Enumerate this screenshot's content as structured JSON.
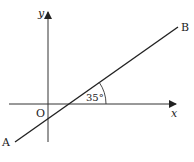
{
  "diagram": {
    "axes": {
      "x_label": "x",
      "y_label": "y",
      "origin_label": "O"
    },
    "line": {
      "start_label": "A",
      "end_label": "B"
    },
    "angle": {
      "label": "35°",
      "value_degrees": 35
    },
    "colors": {
      "stroke": "#222222",
      "background": "#ffffff"
    }
  }
}
